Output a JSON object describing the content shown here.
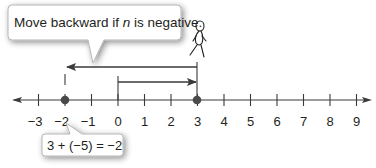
{
  "diagram": {
    "type": "number-line",
    "callout": {
      "text_before": "Move backward if ",
      "text_var": "n",
      "text_after": " is negative."
    },
    "equation": "3 + (−5) = −2",
    "number_line": {
      "min": -3,
      "max": 9,
      "tick_labels": [
        "−3",
        "−2",
        "−1",
        "0",
        "1",
        "2",
        "3",
        "4",
        "5",
        "6",
        "7",
        "8",
        "9"
      ],
      "points": [
        {
          "value": -2,
          "label": "−2"
        },
        {
          "value": 3,
          "label": "3"
        }
      ],
      "arrows": [
        {
          "name": "forward",
          "from": 0,
          "to": 3,
          "description": "Move forward 3"
        },
        {
          "name": "backward",
          "from": 3,
          "to": -2,
          "description": "Move backward 5"
        }
      ]
    },
    "figure": "stick-figure-walker",
    "colors": {
      "line": "#3a3a3a",
      "point": "#4a4a4a",
      "callout_border": "#9a9a9a",
      "text": "#231f20"
    }
  }
}
